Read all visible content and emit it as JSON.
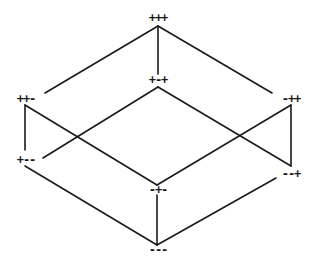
{
  "diagram": {
    "type": "boolean-lattice-cube",
    "nodes": [
      {
        "id": "ppp",
        "label": "+++",
        "x": 158,
        "y": 22
      },
      {
        "id": "pmp",
        "label": "+-+",
        "x": 158,
        "y": 84
      },
      {
        "id": "ppm",
        "label": "++-",
        "x": 26,
        "y": 103
      },
      {
        "id": "mpp",
        "label": "-++",
        "x": 291,
        "y": 103
      },
      {
        "id": "pmm",
        "label": "+--",
        "x": 26,
        "y": 164
      },
      {
        "id": "mmp",
        "label": "--+",
        "x": 291,
        "y": 178
      },
      {
        "id": "mpm",
        "label": "-+-",
        "x": 158,
        "y": 194
      },
      {
        "id": "mmm",
        "label": "---",
        "x": 158,
        "y": 254
      }
    ],
    "edges": [
      {
        "from": "+++",
        "to": "++-",
        "x1": 158,
        "y1": 26,
        "x2": 45,
        "y2": 93
      },
      {
        "from": "+++",
        "to": "-++",
        "x1": 158,
        "y1": 26,
        "x2": 272,
        "y2": 93
      },
      {
        "from": "+++",
        "to": "+-+",
        "x1": 158,
        "y1": 26,
        "x2": 158,
        "y2": 74
      },
      {
        "from": "+-+",
        "to": "+--",
        "x1": 158,
        "y1": 87,
        "x2": 43,
        "y2": 158
      },
      {
        "from": "+-+",
        "to": "--+",
        "x1": 158,
        "y1": 87,
        "x2": 291,
        "y2": 166
      },
      {
        "from": "++-",
        "to": "+--",
        "x1": 25,
        "y1": 105,
        "x2": 25,
        "y2": 150
      },
      {
        "from": "++-",
        "to": "-+-",
        "x1": 25,
        "y1": 105,
        "x2": 157,
        "y2": 185
      },
      {
        "from": "-++",
        "to": "--+",
        "x1": 291,
        "y1": 105,
        "x2": 291,
        "y2": 166
      },
      {
        "from": "-++",
        "to": "-+-",
        "x1": 291,
        "y1": 105,
        "x2": 157,
        "y2": 185
      },
      {
        "from": "+--",
        "to": "---",
        "x1": 25,
        "y1": 166,
        "x2": 157,
        "y2": 245
      },
      {
        "from": "--+",
        "to": "---",
        "x1": 276,
        "y1": 178,
        "x2": 157,
        "y2": 245
      },
      {
        "from": "-+-",
        "to": "---",
        "x1": 157,
        "y1": 195,
        "x2": 157,
        "y2": 245
      }
    ],
    "colors": {
      "line": "#1a1a1a",
      "background": "#ffffff"
    }
  }
}
